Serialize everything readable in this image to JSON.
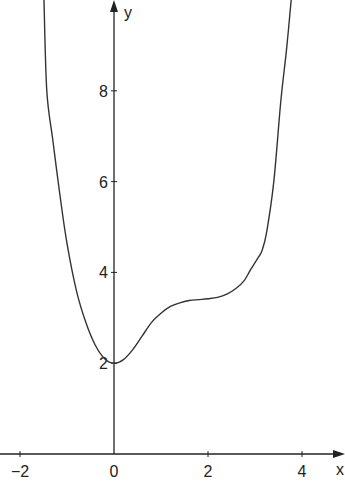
{
  "chart_data": {
    "type": "line",
    "title": "",
    "xlabel": "x",
    "ylabel": "y",
    "xlim": [
      -2.4,
      4.9
    ],
    "ylim": [
      0,
      10
    ],
    "x_ticks": [
      -2,
      0,
      2,
      4
    ],
    "x_tick_labels": [
      "−2",
      "0",
      "2",
      "4"
    ],
    "y_ticks": [
      2,
      4,
      6,
      8
    ],
    "y_tick_labels": [
      "2",
      "4",
      "6",
      "8"
    ],
    "grid": false,
    "legend": "none",
    "series": [
      {
        "name": "f(x)",
        "x": [
          -1.49,
          -1.43,
          -1.3,
          -1.15,
          -1.0,
          -0.8,
          -0.6,
          -0.4,
          -0.2,
          0.0,
          0.2,
          0.4,
          0.6,
          0.8,
          1.0,
          1.2,
          1.4,
          1.6,
          1.8,
          2.0,
          2.2,
          2.4,
          2.6,
          2.77,
          2.9,
          3.05,
          3.15,
          3.25,
          3.4,
          3.55,
          3.67,
          3.77
        ],
        "y": [
          10.0,
          8.0,
          6.9,
          5.7,
          4.64,
          3.6,
          2.9,
          2.4,
          2.1,
          2.0,
          2.08,
          2.3,
          2.6,
          2.9,
          3.1,
          3.25,
          3.33,
          3.38,
          3.4,
          3.42,
          3.45,
          3.52,
          3.65,
          3.82,
          4.05,
          4.3,
          4.48,
          4.9,
          6.0,
          7.78,
          8.9,
          10.0
        ]
      }
    ]
  }
}
